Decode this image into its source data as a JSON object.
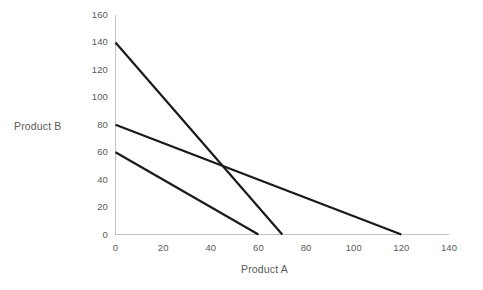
{
  "chart_data": {
    "type": "line",
    "title": "",
    "subtitle": "",
    "xlabel": "Product A",
    "ylabel": "Product B",
    "xlim": [
      0,
      140
    ],
    "ylim": [
      0,
      160
    ],
    "xticks": [
      0,
      20,
      40,
      60,
      80,
      100,
      120,
      140
    ],
    "yticks": [
      0,
      20,
      40,
      60,
      80,
      100,
      120,
      140,
      160
    ],
    "grid": false,
    "legend": "none",
    "annotations": [],
    "series": [
      {
        "name": "line-1",
        "points": [
          [
            0,
            140
          ],
          [
            70,
            0
          ]
        ],
        "x": [
          0,
          70
        ],
        "values": [
          140,
          0
        ],
        "x_intercept": 70,
        "y_intercept": 140,
        "slope": -2,
        "color": "#1a1a1a",
        "width": 2.2
      },
      {
        "name": "line-2",
        "points": [
          [
            0,
            80
          ],
          [
            120,
            0
          ]
        ],
        "x": [
          0,
          120
        ],
        "values": [
          80,
          0
        ],
        "x_intercept": 120,
        "y_intercept": 80,
        "slope": -0.6667,
        "color": "#1a1a1a",
        "width": 2.2
      },
      {
        "name": "line-3",
        "points": [
          [
            0,
            60
          ],
          [
            60,
            0
          ]
        ],
        "x": [
          0,
          60
        ],
        "values": [
          60,
          0
        ],
        "x_intercept": 60,
        "y_intercept": 60,
        "slope": -1,
        "color": "#1a1a1a",
        "width": 2.2
      }
    ]
  },
  "axes": {
    "x_tick_labels": [
      "0",
      "20",
      "40",
      "60",
      "80",
      "100",
      "120",
      "140"
    ],
    "y_tick_labels": [
      "0",
      "20",
      "40",
      "60",
      "80",
      "100",
      "120",
      "140",
      "160"
    ],
    "x_title": "Product A",
    "y_title": "Product B"
  },
  "colors": {
    "background": "#ffffff",
    "axis_line": "#c0c0c0",
    "data_line": "#1a1a1a",
    "text": "#5a5a5a"
  }
}
